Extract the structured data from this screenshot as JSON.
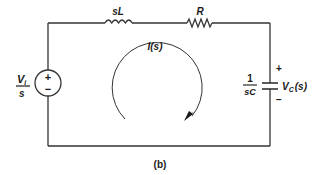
{
  "diagram": {
    "type": "circuit",
    "caption": "(b)",
    "source": {
      "numerator": "V",
      "numerator_sub": "i",
      "denominator": "s",
      "plus": "+",
      "minus": "−"
    },
    "inductor": {
      "label": "sL"
    },
    "resistor": {
      "label": "R"
    },
    "capacitor": {
      "impedance_numerator": "1",
      "impedance_denominator": "sC",
      "voltage_label": "V",
      "voltage_sub": "C",
      "voltage_arg": "(s)",
      "plus": "+",
      "minus": "−"
    },
    "loop_current": {
      "label": "I(s)",
      "direction": "clockwise"
    },
    "colors": {
      "wire": "#333333",
      "text": "#1a1a1a",
      "background": "#ffffff"
    }
  }
}
